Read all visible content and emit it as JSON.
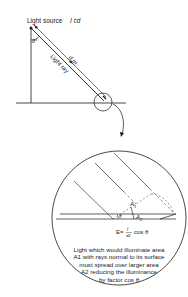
{
  "diagram": {
    "type": "illuminance-cosine-law",
    "labels": {
      "source": "Light source",
      "intensity": "I cd",
      "angle": "θ°",
      "distance": "d m",
      "ray": "Light ray",
      "area1": "A",
      "area1_sub": "1",
      "area2": "A",
      "area2_sub": "2",
      "angle_small": "θ",
      "formula_lhs": "E=",
      "formula_num": "I",
      "formula_den": "d2",
      "formula_rhs": "cos θ"
    },
    "caption": {
      "lines": [
        "Light which would illuminate area",
        "A1 with rays normal to its surface",
        "must spread over larger area",
        "A2 reducing the illuminance",
        "by factor cos θ"
      ]
    },
    "colors": {
      "stroke": "#1a1a1a",
      "dash": "#555555",
      "background": "#ffffff"
    }
  }
}
